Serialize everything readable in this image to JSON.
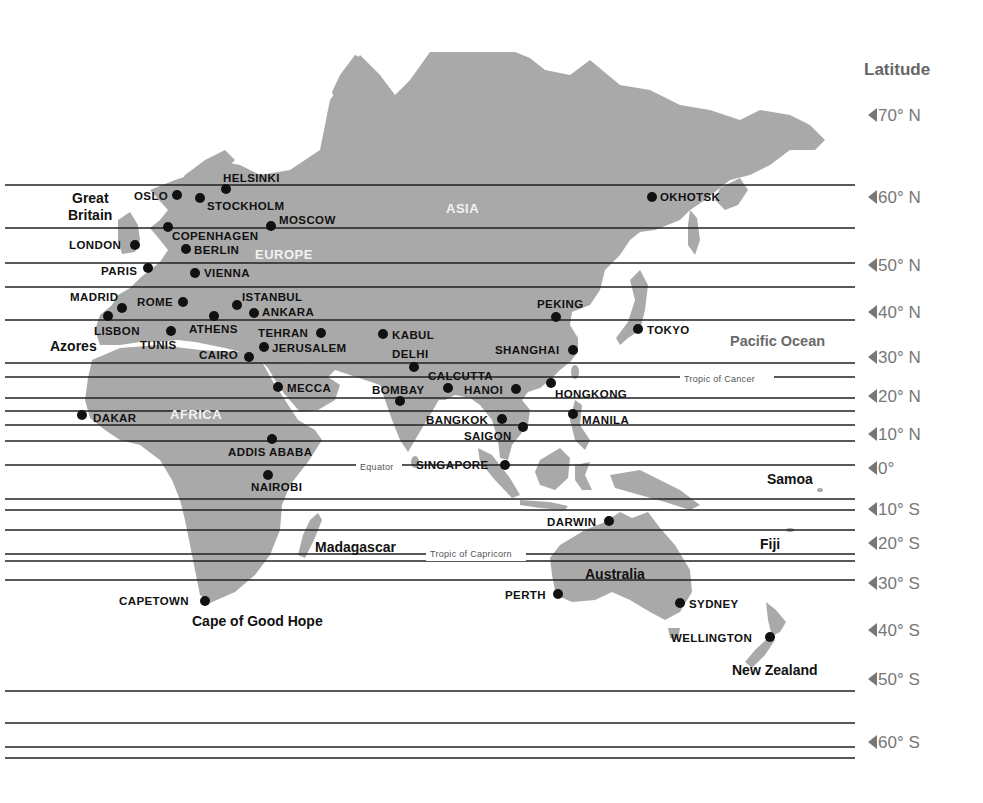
{
  "legend": {
    "title": "Latitude",
    "ticks": [
      {
        "label": "70° N",
        "y": 115
      },
      {
        "label": "60° N",
        "y": 197
      },
      {
        "label": "50° N",
        "y": 265
      },
      {
        "label": "40° N",
        "y": 312
      },
      {
        "label": "30° N",
        "y": 357
      },
      {
        "label": "20° N",
        "y": 396
      },
      {
        "label": "10° N",
        "y": 434
      },
      {
        "label": "0°",
        "y": 468
      },
      {
        "label": "10° S",
        "y": 509
      },
      {
        "label": "20° S",
        "y": 543
      },
      {
        "label": "30° S",
        "y": 583
      },
      {
        "label": "40° S",
        "y": 630
      },
      {
        "label": "50° S",
        "y": 679
      },
      {
        "label": "60° S",
        "y": 742
      }
    ]
  },
  "latitude_lines": [
    185,
    228,
    263,
    287,
    320,
    363,
    377,
    398,
    411,
    425,
    441,
    465,
    499,
    510,
    530,
    554,
    561,
    580,
    691,
    723,
    747,
    758
  ],
  "special_lines": {
    "equator": {
      "label": "Equator",
      "y": 467
    },
    "tropic_of_cancer": {
      "label": "Tropic of Cancer",
      "y": 379
    },
    "tropic_of_capricorn": {
      "label": "Tropic of Capricorn",
      "y": 554
    }
  },
  "continents": [
    {
      "label": "ASIA",
      "x": 446,
      "y": 213
    },
    {
      "label": "EUROPE",
      "x": 255,
      "y": 259
    },
    {
      "label": "AFRICA",
      "x": 170,
      "y": 419
    }
  ],
  "regions": [
    {
      "label": "Great",
      "x": 72,
      "y": 203
    },
    {
      "label": "Britain",
      "x": 68,
      "y": 220
    },
    {
      "label": "Azores",
      "x": 50,
      "y": 351
    },
    {
      "label": "Madagascar",
      "x": 315,
      "y": 552
    },
    {
      "label": "Australia",
      "x": 585,
      "y": 579
    },
    {
      "label": "Cape of Good Hope",
      "x": 192,
      "y": 626
    },
    {
      "label": "New Zealand",
      "x": 732,
      "y": 675
    },
    {
      "label": "Samoa",
      "x": 767,
      "y": 484
    },
    {
      "label": "Fiji",
      "x": 760,
      "y": 549
    }
  ],
  "oceans": [
    {
      "label": "Pacific Ocean",
      "x": 730,
      "y": 346
    }
  ],
  "cities": [
    {
      "name": "HELSINKI",
      "dot": [
        226,
        189
      ],
      "label": [
        223,
        182
      ],
      "anchor": "start"
    },
    {
      "name": "OSLO",
      "dot": [
        177,
        195
      ],
      "label": [
        134,
        200
      ],
      "anchor": "start"
    },
    {
      "name": "STOCKHOLM",
      "dot": [
        200,
        198
      ],
      "label": [
        207,
        210
      ],
      "anchor": "start"
    },
    {
      "name": "OKHOTSK",
      "dot": [
        652,
        197
      ],
      "label": [
        660,
        201
      ],
      "anchor": "start"
    },
    {
      "name": "COPENHAGEN",
      "dot": [
        168,
        227
      ],
      "label": [
        172,
        240
      ],
      "anchor": "start"
    },
    {
      "name": "MOSCOW",
      "dot": [
        271,
        226
      ],
      "label": [
        279,
        224
      ],
      "anchor": "start"
    },
    {
      "name": "LONDON",
      "dot": [
        135,
        245
      ],
      "label": [
        69,
        249
      ],
      "anchor": "start"
    },
    {
      "name": "BERLIN",
      "dot": [
        186,
        249
      ],
      "label": [
        194,
        254
      ],
      "anchor": "start"
    },
    {
      "name": "PARIS",
      "dot": [
        148,
        268
      ],
      "label": [
        101,
        275
      ],
      "anchor": "start"
    },
    {
      "name": "VIENNA",
      "dot": [
        195,
        273
      ],
      "label": [
        204,
        277
      ],
      "anchor": "start"
    },
    {
      "name": "MADRID",
      "dot": [
        122,
        308
      ],
      "label": [
        70,
        301
      ],
      "anchor": "start"
    },
    {
      "name": "ROME",
      "dot": [
        183,
        302
      ],
      "label": [
        137,
        306
      ],
      "anchor": "start"
    },
    {
      "name": "ISTANBUL",
      "dot": [
        237,
        305
      ],
      "label": [
        242,
        301
      ],
      "anchor": "start"
    },
    {
      "name": "ANKARA",
      "dot": [
        254,
        313
      ],
      "label": [
        262,
        316
      ],
      "anchor": "start"
    },
    {
      "name": "LISBON",
      "dot": [
        108,
        316
      ],
      "label": [
        94,
        335
      ],
      "anchor": "start"
    },
    {
      "name": "ATHENS",
      "dot": [
        214,
        316
      ],
      "label": [
        189,
        333
      ],
      "anchor": "start"
    },
    {
      "name": "TUNIS",
      "dot": [
        171,
        331
      ],
      "label": [
        140,
        349
      ],
      "anchor": "start"
    },
    {
      "name": "TEHRAN",
      "dot": [
        321,
        333
      ],
      "label": [
        258,
        337
      ],
      "anchor": "start"
    },
    {
      "name": "KABUL",
      "dot": [
        383,
        334
      ],
      "label": [
        392,
        339
      ],
      "anchor": "start"
    },
    {
      "name": "PEKING",
      "dot": [
        556,
        317
      ],
      "label": [
        537,
        308
      ],
      "anchor": "start"
    },
    {
      "name": "TOKYO",
      "dot": [
        638,
        329
      ],
      "label": [
        647,
        334
      ],
      "anchor": "start"
    },
    {
      "name": "JERUSALEM",
      "dot": [
        264,
        347
      ],
      "label": [
        272,
        352
      ],
      "anchor": "start"
    },
    {
      "name": "CAIRO",
      "dot": [
        249,
        357
      ],
      "label": [
        199,
        359
      ],
      "anchor": "start"
    },
    {
      "name": "SHANGHAI",
      "dot": [
        573,
        350
      ],
      "label": [
        495,
        354
      ],
      "anchor": "start"
    },
    {
      "name": "DELHI",
      "dot": [
        414,
        367
      ],
      "label": [
        392,
        358
      ],
      "anchor": "start"
    },
    {
      "name": "CALCUTTA",
      "dot": [
        448,
        388
      ],
      "label": [
        428,
        380
      ],
      "anchor": "start"
    },
    {
      "name": "HANOI",
      "dot": [
        516,
        389
      ],
      "label": [
        464,
        394
      ],
      "anchor": "start"
    },
    {
      "name": "HONGKONG",
      "dot": [
        551,
        383
      ],
      "label": [
        555,
        398
      ],
      "anchor": "start"
    },
    {
      "name": "MECCA",
      "dot": [
        278,
        387
      ],
      "label": [
        287,
        392
      ],
      "anchor": "start"
    },
    {
      "name": "BOMBAY",
      "dot": [
        400,
        401
      ],
      "label": [
        372,
        394
      ],
      "anchor": "start"
    },
    {
      "name": "DAKAR",
      "dot": [
        82,
        415
      ],
      "label": [
        93,
        422
      ],
      "anchor": "start"
    },
    {
      "name": "BANGKOK",
      "dot": [
        502,
        419
      ],
      "label": [
        426,
        424
      ],
      "anchor": "start"
    },
    {
      "name": "MANILA",
      "dot": [
        573,
        414
      ],
      "label": [
        582,
        424
      ],
      "anchor": "start"
    },
    {
      "name": "SAIGON",
      "dot": [
        523,
        427
      ],
      "label": [
        464,
        440
      ],
      "anchor": "start"
    },
    {
      "name": "ADDIS ABABA",
      "dot": [
        272,
        439
      ],
      "label": [
        228,
        456
      ],
      "anchor": "start"
    },
    {
      "name": "SINGAPORE",
      "dot": [
        505,
        465
      ],
      "label": [
        416,
        469
      ],
      "anchor": "start"
    },
    {
      "name": "NAIROBI",
      "dot": [
        268,
        475
      ],
      "label": [
        251,
        491
      ],
      "anchor": "start"
    },
    {
      "name": "DARWIN",
      "dot": [
        609,
        521
      ],
      "label": [
        547,
        526
      ],
      "anchor": "start"
    },
    {
      "name": "CAPETOWN",
      "dot": [
        205,
        601
      ],
      "label": [
        119,
        605
      ],
      "anchor": "start"
    },
    {
      "name": "PERTH",
      "dot": [
        558,
        594
      ],
      "label": [
        505,
        599
      ],
      "anchor": "start"
    },
    {
      "name": "SYDNEY",
      "dot": [
        680,
        603
      ],
      "label": [
        689,
        608
      ],
      "anchor": "start"
    },
    {
      "name": "WELLINGTON",
      "dot": [
        770,
        637
      ],
      "label": [
        671,
        642
      ],
      "anchor": "start"
    }
  ],
  "colors": {
    "land": "#a9a9a9",
    "ocean": "#ffffff",
    "lines": "#222222",
    "legend_text": "#777777"
  }
}
